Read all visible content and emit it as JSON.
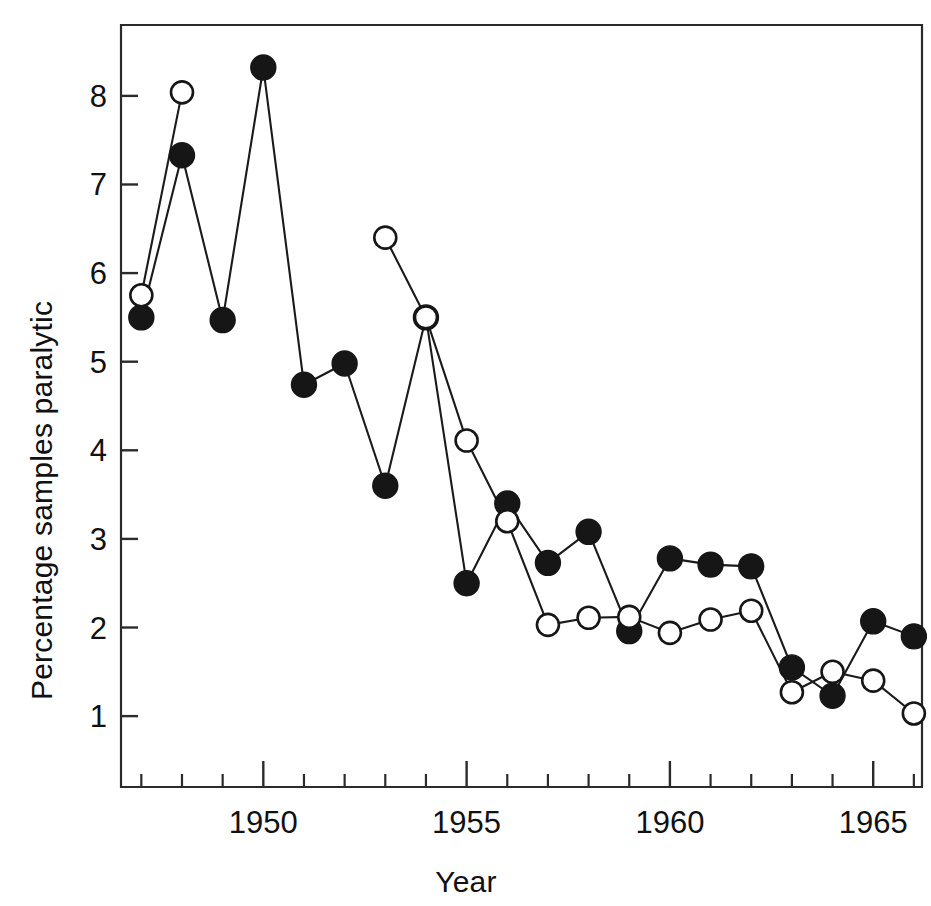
{
  "figure": {
    "background_color": "#ffffff",
    "ink_color": "#161616"
  },
  "chart_data": {
    "type": "line",
    "title": "",
    "subtitle": "",
    "xlabel": "Year",
    "ylabel": "Percentage samples paralytic",
    "xlim": [
      1946.5,
      1966.2
    ],
    "ylim": [
      0.2,
      8.8
    ],
    "grid": false,
    "legend_position": "none",
    "x_major_ticks": [
      1950,
      1955,
      1960,
      1965
    ],
    "x_major_tick_labels": [
      "1950",
      "1955",
      "1960",
      "1965"
    ],
    "x_minor_ticks": [
      1947,
      1948,
      1949,
      1951,
      1952,
      1953,
      1954,
      1956,
      1957,
      1958,
      1959,
      1961,
      1962,
      1963,
      1964,
      1966
    ],
    "y_ticks": [
      1,
      2,
      3,
      4,
      5,
      6,
      7,
      8
    ],
    "y_tick_labels": [
      "1",
      "2",
      "3",
      "4",
      "5",
      "6",
      "7",
      "8"
    ],
    "series": [
      {
        "name": "filled-circles",
        "marker": "filled-circle",
        "marker_fill": "#161616",
        "marker_edge": "#161616",
        "line_color": "#1a1a1a",
        "x": [
          1947,
          1948,
          1949,
          1950,
          1951,
          1952,
          1953,
          1954,
          1955,
          1956,
          1957,
          1958,
          1959,
          1960,
          1961,
          1962,
          1963,
          1964,
          1965,
          1966
        ],
        "values": [
          5.5,
          7.33,
          5.47,
          8.32,
          4.74,
          4.98,
          3.6,
          5.5,
          2.5,
          3.4,
          2.73,
          3.08,
          1.96,
          2.78,
          2.71,
          2.69,
          1.55,
          1.23,
          2.07,
          1.9
        ]
      },
      {
        "name": "open-circles",
        "marker": "open-circle",
        "marker_fill": "#ffffff",
        "marker_edge": "#161616",
        "line_color": "#1a1a1a",
        "x": [
          1947,
          1948,
          1953,
          1954,
          1955,
          1956,
          1957,
          1958,
          1959,
          1960,
          1961,
          1962,
          1963,
          1964,
          1965,
          1966
        ],
        "values": [
          5.75,
          8.04,
          6.4,
          5.5,
          4.11,
          3.2,
          2.03,
          2.11,
          2.12,
          1.94,
          2.09,
          2.19,
          1.27,
          1.5,
          1.4,
          1.03
        ],
        "segments": [
          {
            "x": [
              1947,
              1948
            ],
            "values": [
              5.75,
              8.04
            ]
          },
          {
            "x": [
              1953,
              1954,
              1955,
              1956,
              1957,
              1958,
              1959,
              1960,
              1961,
              1962,
              1963,
              1964,
              1965,
              1966
            ],
            "values": [
              6.4,
              5.5,
              4.11,
              3.2,
              2.03,
              2.11,
              2.12,
              1.94,
              2.09,
              2.19,
              1.27,
              1.5,
              1.4,
              1.03
            ]
          }
        ]
      }
    ]
  }
}
